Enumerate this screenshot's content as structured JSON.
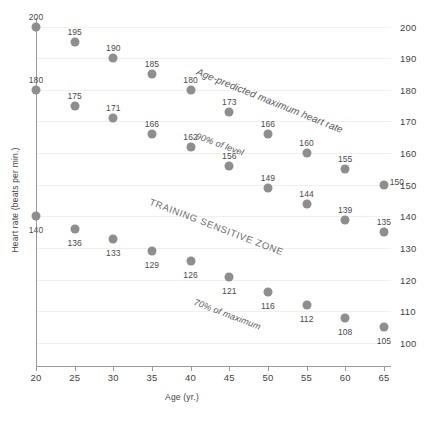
{
  "chart_data": {
    "type": "scatter",
    "title": "",
    "xlabel": "Age (yr.)",
    "ylabel": "Heart rate (beats per min.)",
    "xlim": [
      20,
      65
    ],
    "ylim": [
      95,
      205
    ],
    "xticks": [
      20,
      25,
      30,
      35,
      40,
      45,
      50,
      55,
      60,
      65
    ],
    "yticks": [
      100,
      110,
      120,
      130,
      140,
      150,
      160,
      170,
      180,
      190,
      200
    ],
    "grid": true,
    "legend": "none",
    "point_color": "#8e8e8e",
    "x": [
      20,
      25,
      30,
      35,
      40,
      45,
      50,
      55,
      60,
      65
    ],
    "series": [
      {
        "name": "Age-predicted maximum heart rate",
        "values": [
          200,
          195,
          190,
          185,
          180,
          173,
          166,
          160,
          155,
          150
        ]
      },
      {
        "name": "90% of level",
        "values": [
          180,
          175,
          171,
          166,
          162,
          156,
          149,
          144,
          139,
          135
        ]
      },
      {
        "name": "70% of maximum",
        "values": [
          140,
          136,
          133,
          129,
          126,
          121,
          116,
          112,
          108,
          105
        ]
      }
    ],
    "annotations": [
      {
        "id": "max-hr",
        "text": "Age-predicted maximum heart rate"
      },
      {
        "id": "ninety-percent",
        "text": "90% of level"
      },
      {
        "id": "zone",
        "text": "TRAINING SENSITIVE ZONE"
      },
      {
        "id": "seventy-percent",
        "text": "70% of maximum"
      }
    ]
  }
}
